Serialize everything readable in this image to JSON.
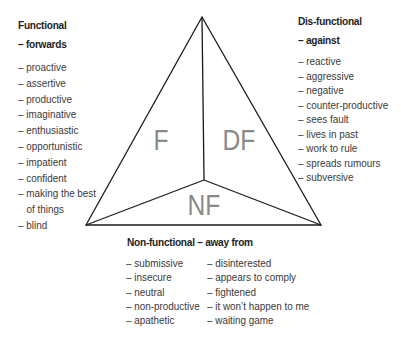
{
  "diagram": {
    "regions": {
      "functional": "F",
      "dysfunctional": "DF",
      "non_functional": "NF"
    },
    "colors": {
      "line": "#1a1a1a",
      "region_label": "#8a8a8a",
      "text": "#3a3a3a"
    }
  },
  "functional": {
    "heading_line1": "Functional",
    "heading_line2": "– forwards",
    "items": [
      "– proactive",
      "– assertive",
      "– productive",
      "– imaginative",
      "– enthusiastic",
      "– opportunistic",
      "– impatient",
      "– confident",
      "– making the best",
      "of things",
      "– blind"
    ]
  },
  "dysfunctional": {
    "heading_line1": "Dis-functional",
    "heading_line2": "– against",
    "items": [
      "– reactive",
      "– aggressive",
      "– negative",
      "– counter-productive",
      "– sees fault",
      "– lives in past",
      "– work to rule",
      "– spreads rumours",
      "– subversive"
    ]
  },
  "non_functional": {
    "heading": "Non-functional – away from",
    "column1": [
      "– submissive",
      "– insecure",
      "– neutral",
      "– non-productive",
      "– apathetic"
    ],
    "column2": [
      "– disinterested",
      "– appears to comply",
      "– fightened",
      "– it won’t happen to me",
      "– waiting game"
    ]
  }
}
